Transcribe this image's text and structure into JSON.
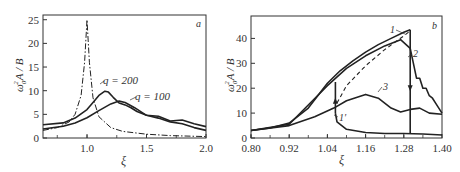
{
  "chart_data": [
    {
      "panel": "a",
      "type": "line",
      "xlabel": "ξ",
      "ylabel": "ω0²A/B",
      "xlim": [
        0.63,
        2.0
      ],
      "ylim": [
        0,
        26
      ],
      "xticks": [
        "1.0",
        "1.5",
        "2.0"
      ],
      "xtick_values": [
        1.0,
        1.5,
        2.0
      ],
      "yticks": [
        "0",
        "5",
        "10",
        "15",
        "20",
        "25"
      ],
      "ytick_values": [
        0,
        5,
        10,
        15,
        20,
        25
      ],
      "grid": false,
      "series": [
        {
          "name": "linear resonance (dash-dot)",
          "style": "dashdot",
          "x": [
            0.63,
            0.75,
            0.85,
            0.9,
            0.95,
            0.98,
            1.0,
            1.02,
            1.05,
            1.1,
            1.2,
            1.3,
            1.5,
            1.7,
            2.0
          ],
          "y": [
            1.6,
            2.2,
            3.4,
            5.0,
            9.0,
            16.0,
            25.0,
            16.0,
            8.5,
            4.5,
            2.2,
            1.4,
            0.8,
            0.5,
            0.3
          ]
        },
        {
          "name": "q = 200",
          "style": "solid",
          "x": [
            0.63,
            0.8,
            0.9,
            1.0,
            1.05,
            1.1,
            1.15,
            1.18,
            1.22,
            1.27,
            1.32,
            1.37,
            1.42,
            1.5,
            1.6,
            1.7,
            1.8,
            1.9,
            2.0
          ],
          "y": [
            2.8,
            3.2,
            4.2,
            6.0,
            7.5,
            9.0,
            9.9,
            9.7,
            8.6,
            7.4,
            7.0,
            6.4,
            5.6,
            4.8,
            4.6,
            3.6,
            3.8,
            3.0,
            2.4
          ]
        },
        {
          "name": "q = 100",
          "style": "solid",
          "x": [
            0.63,
            0.8,
            0.9,
            1.0,
            1.1,
            1.2,
            1.27,
            1.32,
            1.4,
            1.5,
            1.6,
            1.7,
            1.8,
            1.9,
            2.0
          ],
          "y": [
            1.9,
            2.5,
            3.2,
            4.3,
            5.8,
            7.2,
            7.8,
            7.5,
            6.4,
            4.8,
            4.2,
            3.4,
            3.0,
            2.2,
            1.6
          ]
        }
      ],
      "annotations": [
        {
          "text": "q = 200",
          "x": 1.25,
          "y": 11.5
        },
        {
          "text": "q = 100",
          "x": 1.45,
          "y": 8.0
        },
        {
          "text": "a",
          "x": 1.97,
          "y": 24.5
        }
      ]
    },
    {
      "panel": "b",
      "type": "line",
      "xlabel": "ξ",
      "ylabel": "ω0²A/B",
      "xlim": [
        0.8,
        1.4
      ],
      "ylim": [
        0,
        49
      ],
      "xticks": [
        "0.80",
        "0.92",
        "1.04",
        "1.16",
        "1.28",
        "1.40"
      ],
      "xtick_values": [
        0.8,
        0.92,
        1.04,
        1.16,
        1.28,
        1.4
      ],
      "yticks": [
        "0",
        "10",
        "20",
        "30",
        "40"
      ],
      "ytick_values": [
        0,
        10,
        20,
        30,
        40
      ],
      "grid": false,
      "series": [
        {
          "name": "1 (upper branch)",
          "style": "solid",
          "x": [
            0.8,
            0.86,
            0.92,
            0.98,
            1.04,
            1.08,
            1.12,
            1.16,
            1.2,
            1.24,
            1.28,
            1.3
          ],
          "y": [
            3,
            4,
            6,
            12,
            22,
            27,
            31,
            34.5,
            37.5,
            40,
            42.5,
            43.5
          ]
        },
        {
          "name": "1 (jump down at 1.30)",
          "style": "solid",
          "x": [
            1.3,
            1.3
          ],
          "y": [
            43.5,
            2
          ]
        },
        {
          "name": "1' (lower branch)",
          "style": "solid",
          "x": [
            1.065,
            1.07,
            1.1,
            1.16,
            1.22,
            1.28,
            1.34,
            1.4
          ],
          "y": [
            10,
            6.5,
            3.5,
            2.2,
            1.8,
            1.8,
            1.6,
            1.2
          ]
        },
        {
          "name": "1' (jump up at 1.065)",
          "style": "solid",
          "x": [
            1.065,
            1.065
          ],
          "y": [
            10,
            22.5
          ]
        },
        {
          "name": "unstable branch (dashed)",
          "style": "dashed",
          "x": [
            1.07,
            1.1,
            1.16,
            1.22,
            1.28,
            1.3
          ],
          "y": [
            14,
            21,
            29,
            35.5,
            41,
            43
          ]
        },
        {
          "name": "2",
          "style": "solid",
          "x": [
            0.8,
            0.92,
            1.04,
            1.1,
            1.16,
            1.22,
            1.27,
            1.3,
            1.31,
            1.32,
            1.33,
            1.34,
            1.35,
            1.36,
            1.37,
            1.38,
            1.39,
            1.4
          ],
          "y": [
            3,
            5.5,
            21,
            28,
            33,
            37,
            39.5,
            36,
            30,
            24,
            24,
            20,
            20,
            17,
            16,
            14,
            12,
            10
          ]
        },
        {
          "name": "3",
          "style": "solid",
          "x": [
            0.8,
            0.92,
            1.0,
            1.06,
            1.1,
            1.16,
            1.2,
            1.24,
            1.27,
            1.3,
            1.33,
            1.36,
            1.4
          ],
          "y": [
            3,
            5,
            8.5,
            12,
            15,
            17.5,
            16,
            12,
            10.5,
            11.5,
            12,
            10,
            9.5
          ]
        }
      ],
      "annotations": [
        {
          "text": "1",
          "x": 1.265,
          "y": 44
        },
        {
          "text": "2",
          "x": 1.32,
          "y": 34
        },
        {
          "text": "3",
          "x": 1.215,
          "y": 19
        },
        {
          "text": "1'",
          "x": 1.07,
          "y": 9
        },
        {
          "text": "b",
          "x": 1.38,
          "y": 45
        }
      ]
    }
  ],
  "labels": {
    "panel_a": "a",
    "panel_b": "b",
    "xi": "ξ",
    "ylabel_main": "ω",
    "ylabel_sub": "0",
    "ylabel_sup": "2",
    "ylabel_rest": "A / B",
    "q200": "q = 200",
    "q100": "q = 100",
    "curve1": "1",
    "curve2": "2",
    "curve3": "3",
    "curve1p": "1′"
  }
}
